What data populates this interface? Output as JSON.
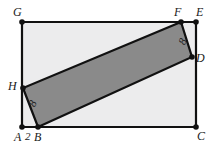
{
  "figure": {
    "canvas": {
      "width": 217,
      "height": 147
    },
    "colors": {
      "background": "#ffffff",
      "outer_fill": "#ececed",
      "inner_fill": "#8a8a8a",
      "stroke": "#111111",
      "label": "#1a1a1a"
    },
    "outer_rectangle": {
      "name": "AEGC",
      "corners": [
        {
          "label": "G",
          "x": 22,
          "y": 22
        },
        {
          "label": "E",
          "x": 196,
          "y": 22
        },
        {
          "label": "C",
          "x": 196,
          "y": 127
        },
        {
          "label": "A",
          "x": 22,
          "y": 127
        }
      ]
    },
    "inner_rectangle": {
      "name": "BDFH",
      "corners": [
        {
          "label": "B",
          "x": 38,
          "y": 127
        },
        {
          "label": "D",
          "x": 192,
          "y": 57
        },
        {
          "label": "F",
          "x": 181,
          "y": 22
        },
        {
          "label": "H",
          "x": 23,
          "y": 88
        }
      ]
    },
    "vertices": [
      {
        "id": "G",
        "label": "G",
        "x": 22,
        "y": 22,
        "label_x": 13,
        "label_y": 6,
        "dot": true
      },
      {
        "id": "F",
        "label": "F",
        "x": 181,
        "y": 22,
        "label_x": 174,
        "label_y": 6,
        "dot": true
      },
      {
        "id": "E",
        "label": "E",
        "x": 196,
        "y": 22,
        "label_x": 196,
        "label_y": 6,
        "dot": true
      },
      {
        "id": "D",
        "label": "D",
        "x": 192,
        "y": 57,
        "label_x": 196,
        "label_y": 52,
        "dot": true
      },
      {
        "id": "C",
        "label": "C",
        "x": 196,
        "y": 127,
        "label_x": 197,
        "label_y": 130,
        "dot": true
      },
      {
        "id": "H",
        "label": "H",
        "x": 23,
        "y": 88,
        "label_x": 8,
        "label_y": 80,
        "dot": true
      },
      {
        "id": "A",
        "label": "A",
        "x": 22,
        "y": 127,
        "label_x": 14,
        "label_y": 131,
        "dot": true
      },
      {
        "id": "B",
        "label": "B",
        "x": 38,
        "y": 127,
        "label_x": 34,
        "label_y": 131,
        "dot": true
      }
    ],
    "measurements": [
      {
        "id": "ab-length",
        "text": "2",
        "x": 25,
        "y": 131,
        "rotation": 0
      },
      {
        "id": "hb-length",
        "text": "8",
        "x": 30,
        "y": 98,
        "rotation": -66
      },
      {
        "id": "fd-length",
        "text": "8",
        "x": 180,
        "y": 36,
        "rotation": -66
      }
    ]
  }
}
